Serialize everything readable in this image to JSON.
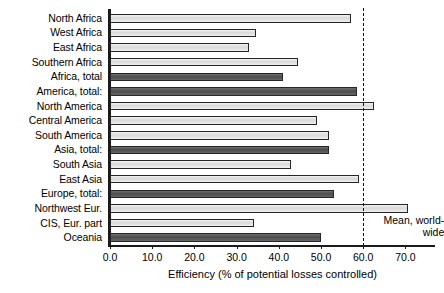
{
  "chart_data": {
    "type": "bar",
    "orientation": "horizontal",
    "title": "",
    "xlabel": "Efficiency (% of potential losses controlled)",
    "ylabel": "",
    "xlim": [
      0.0,
      77.0
    ],
    "xticks": [
      "0.0",
      "10.0",
      "20.0",
      "30.0",
      "40.0",
      "50.0",
      "60.0",
      "70.0"
    ],
    "xtick_values": [
      0,
      10,
      20,
      30,
      40,
      50,
      60,
      70
    ],
    "grid": false,
    "legend": "none",
    "categories": [
      "North Africa",
      "West Africa",
      "East Africa",
      "Southern Africa",
      "Africa, total",
      "America, total:",
      "North America",
      "Central America",
      "South America",
      "Asia, total:",
      "South Asia",
      "East Asia",
      "Europe, total:",
      "Northwest Eur.",
      "CIS, Eur. part",
      "Oceania"
    ],
    "values": [
      57.0,
      34.5,
      33.0,
      44.5,
      41.0,
      58.5,
      62.5,
      49.0,
      52.0,
      52.0,
      43.0,
      59.0,
      53.0,
      70.5,
      34.0,
      50.0
    ],
    "bar_styles": [
      "light",
      "light",
      "light",
      "light",
      "dark",
      "dark",
      "light",
      "light",
      "light",
      "dark",
      "light",
      "light",
      "dark",
      "light",
      "light",
      "dark"
    ],
    "annotations": [
      {
        "name": "mean-worldwide",
        "line1": "Mean, world-",
        "line2": "wide",
        "value": 60.0,
        "style": "dashed-vertical-line"
      }
    ],
    "colors": {
      "light_bar": "#d9d9d9",
      "dark_bar": "#4d4d4d",
      "axis": "#1a1a1a",
      "mean_line": "#111111"
    }
  }
}
